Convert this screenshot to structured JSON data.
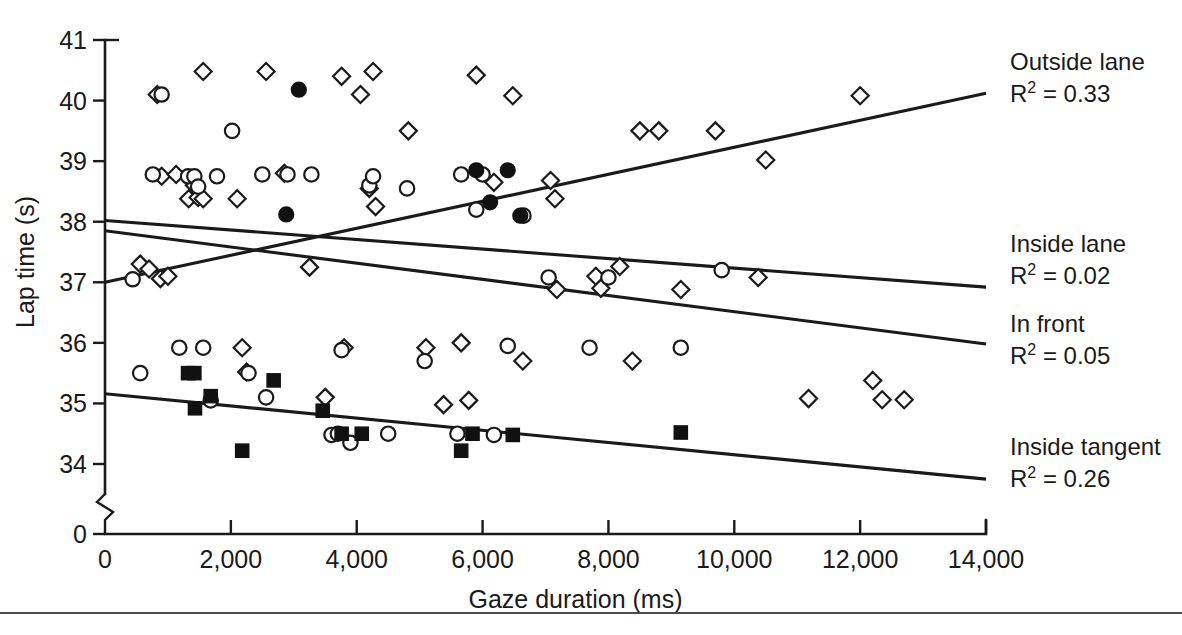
{
  "chart_data": {
    "type": "scatter",
    "title": "",
    "xlabel": "Gaze duration (ms)",
    "ylabel": "Lap time (s)",
    "xlim": [
      0,
      14000
    ],
    "ylim": [
      33.6,
      41
    ],
    "grid": false,
    "axis_break_y": true,
    "y_axis_origin_label": "0",
    "xticks": [
      0,
      2000,
      4000,
      6000,
      8000,
      10000,
      12000,
      14000
    ],
    "xticklabels": [
      "0",
      "2,000",
      "4,000",
      "6,000",
      "8,000",
      "10,000",
      "12,000",
      "14,000"
    ],
    "yticks": [
      34,
      35,
      36,
      37,
      38,
      39,
      40,
      41
    ],
    "yticklabels": [
      "34",
      "35",
      "36",
      "37",
      "38",
      "39",
      "40",
      "41"
    ],
    "legend_position": "right",
    "series": [
      {
        "name": "Outside lane",
        "r_squared": 0.33,
        "marker": "open-diamond",
        "legend_label": "Outside lane",
        "legend_stat": "R2 = 0.33",
        "fit": {
          "x0": 0,
          "y0": 37.0,
          "x1": 14000,
          "y1": 40.12
        },
        "points": [
          [
            560,
            37.3
          ],
          [
            700,
            37.22
          ],
          [
            830,
            40.1
          ],
          [
            880,
            37.06
          ],
          [
            900,
            38.75
          ],
          [
            1000,
            37.1
          ],
          [
            1130,
            38.78
          ],
          [
            1330,
            38.38
          ],
          [
            1420,
            38.6
          ],
          [
            1480,
            38.4
          ],
          [
            1560,
            40.48
          ],
          [
            1560,
            38.38
          ],
          [
            2100,
            38.38
          ],
          [
            2180,
            35.92
          ],
          [
            2250,
            35.52
          ],
          [
            2560,
            40.48
          ],
          [
            2850,
            38.8
          ],
          [
            3250,
            37.25
          ],
          [
            3500,
            35.1
          ],
          [
            3760,
            40.4
          ],
          [
            3800,
            35.92
          ],
          [
            4060,
            40.1
          ],
          [
            4200,
            38.55
          ],
          [
            4260,
            40.48
          ],
          [
            4300,
            38.25
          ],
          [
            4820,
            39.5
          ],
          [
            5100,
            35.92
          ],
          [
            5380,
            34.98
          ],
          [
            5660,
            36.0
          ],
          [
            5780,
            35.05
          ],
          [
            5900,
            40.42
          ],
          [
            6180,
            38.65
          ],
          [
            6480,
            40.08
          ],
          [
            6640,
            35.7
          ],
          [
            7080,
            38.68
          ],
          [
            7150,
            38.38
          ],
          [
            7180,
            36.88
          ],
          [
            7800,
            37.1
          ],
          [
            7880,
            36.9
          ],
          [
            8180,
            37.26
          ],
          [
            8380,
            35.7
          ],
          [
            8500,
            39.5
          ],
          [
            8800,
            39.5
          ],
          [
            9150,
            36.88
          ],
          [
            9700,
            39.5
          ],
          [
            10380,
            37.08
          ],
          [
            10500,
            39.02
          ],
          [
            11180,
            35.08
          ],
          [
            12000,
            40.08
          ],
          [
            12200,
            35.38
          ],
          [
            12350,
            35.06
          ],
          [
            12700,
            35.06
          ]
        ]
      },
      {
        "name": "Inside lane",
        "r_squared": 0.02,
        "marker": "open-circle",
        "legend_label": "Inside lane",
        "legend_stat": "R2 = 0.02",
        "fit": {
          "x0": 0,
          "y0": 38.02,
          "x1": 14000,
          "y1": 36.92
        },
        "points": [
          [
            440,
            37.05
          ],
          [
            560,
            35.5
          ],
          [
            760,
            38.78
          ],
          [
            900,
            40.1
          ],
          [
            1180,
            35.92
          ],
          [
            1320,
            38.75
          ],
          [
            1420,
            38.75
          ],
          [
            1480,
            38.58
          ],
          [
            1560,
            35.92
          ],
          [
            1680,
            35.05
          ],
          [
            1780,
            38.75
          ],
          [
            2020,
            39.5
          ],
          [
            2280,
            35.5
          ],
          [
            2500,
            38.78
          ],
          [
            2560,
            35.1
          ],
          [
            2900,
            38.78
          ],
          [
            3280,
            38.78
          ],
          [
            3600,
            34.48
          ],
          [
            3700,
            34.5
          ],
          [
            3760,
            35.88
          ],
          [
            3900,
            34.35
          ],
          [
            4200,
            38.6
          ],
          [
            4260,
            38.75
          ],
          [
            4500,
            34.5
          ],
          [
            4800,
            38.55
          ],
          [
            5080,
            35.7
          ],
          [
            5600,
            34.5
          ],
          [
            5660,
            38.78
          ],
          [
            5900,
            38.2
          ],
          [
            6000,
            38.78
          ],
          [
            6180,
            34.48
          ],
          [
            6400,
            35.95
          ],
          [
            6650,
            38.1
          ],
          [
            7050,
            37.08
          ],
          [
            7700,
            35.92
          ],
          [
            8000,
            37.08
          ],
          [
            9150,
            35.92
          ],
          [
            9800,
            37.2
          ]
        ]
      },
      {
        "name": "In front",
        "r_squared": 0.05,
        "marker": "filled-circle",
        "legend_label": "In front",
        "legend_stat": "R2 = 0.05",
        "fit": {
          "x0": 0,
          "y0": 37.85,
          "x1": 14000,
          "y1": 35.98
        },
        "points": [
          [
            2880,
            38.12
          ],
          [
            3080,
            40.18
          ],
          [
            5900,
            38.85
          ],
          [
            6120,
            38.32
          ],
          [
            6400,
            38.85
          ],
          [
            6600,
            38.1
          ]
        ]
      },
      {
        "name": "Inside tangent",
        "r_squared": 0.26,
        "marker": "filled-square",
        "legend_label": "Inside tangent",
        "legend_stat": "R2 = 0.26",
        "fit": {
          "x0": 0,
          "y0": 35.16,
          "x1": 14000,
          "y1": 33.75
        },
        "points": [
          [
            1320,
            35.5
          ],
          [
            1420,
            35.5
          ],
          [
            1430,
            34.92
          ],
          [
            1680,
            35.12
          ],
          [
            2180,
            34.22
          ],
          [
            2680,
            35.38
          ],
          [
            3460,
            34.88
          ],
          [
            3760,
            34.5
          ],
          [
            4080,
            34.5
          ],
          [
            5660,
            34.22
          ],
          [
            5840,
            34.5
          ],
          [
            6480,
            34.48
          ],
          [
            9150,
            34.52
          ]
        ]
      }
    ]
  },
  "legend": [
    {
      "label": "Outside lane",
      "stat_prefix": "R",
      "stat_sup": "2",
      "stat_value": " = 0.33"
    },
    {
      "label": "Inside lane",
      "stat_prefix": "R",
      "stat_sup": "2",
      "stat_value": " = 0.02"
    },
    {
      "label": "In front",
      "stat_prefix": "R",
      "stat_sup": "2",
      "stat_value": " = 0.05"
    },
    {
      "label": "Inside tangent",
      "stat_prefix": "R",
      "stat_sup": "2",
      "stat_value": " = 0.26"
    }
  ],
  "caption": {
    "text": ""
  }
}
